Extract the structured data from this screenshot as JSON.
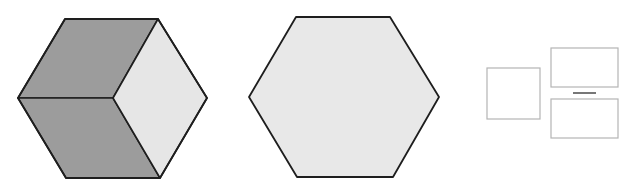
{
  "figure": {
    "width": 629,
    "height": 191,
    "background": "#ffffff"
  },
  "colors": {
    "outline": "#1e1e1e",
    "dark_face": "#9c9c9c",
    "light_face": "#e6e6e6",
    "hex_fill": "#e8e8e8",
    "box_outline": "#b4b4b4",
    "dash": "#555555"
  },
  "shapes": {
    "cube_hexagon": {
      "label": "cube-hexagon",
      "vertices": [
        [
          65,
          19
        ],
        [
          158,
          19
        ],
        [
          207,
          98
        ],
        [
          160,
          178
        ],
        [
          66,
          178
        ],
        [
          18,
          98
        ]
      ],
      "center": [
        113,
        98
      ],
      "faces": [
        {
          "name": "upper-left-face",
          "fill": "#9c9c9c",
          "points": [
            [
              65,
              19
            ],
            [
              158,
              19
            ],
            [
              113,
              98
            ],
            [
              18,
              98
            ]
          ]
        },
        {
          "name": "lower-left-face",
          "fill": "#9c9c9c",
          "points": [
            [
              18,
              98
            ],
            [
              113,
              98
            ],
            [
              160,
              178
            ],
            [
              66,
              178
            ]
          ]
        },
        {
          "name": "right-face",
          "fill": "#e6e6e6",
          "points": [
            [
              158,
              19
            ],
            [
              207,
              98
            ],
            [
              160,
              178
            ],
            [
              113,
              98
            ]
          ]
        }
      ]
    },
    "plain_hexagon": {
      "label": "plain-hexagon",
      "vertices": [
        [
          296,
          17
        ],
        [
          390,
          17
        ],
        [
          439,
          97
        ],
        [
          393,
          177
        ],
        [
          297,
          177
        ],
        [
          249,
          97
        ]
      ],
      "fill": "#e8e8e8"
    },
    "square_box": {
      "x": 487,
      "y": 68,
      "w": 53,
      "h": 51
    },
    "top_rect": {
      "x": 551,
      "y": 48,
      "w": 67,
      "h": 39
    },
    "dash": {
      "x1": 573,
      "y1": 93,
      "x2": 596,
      "y2": 93
    },
    "bottom_rect": {
      "x": 551,
      "y": 99,
      "w": 67,
      "h": 39
    }
  }
}
